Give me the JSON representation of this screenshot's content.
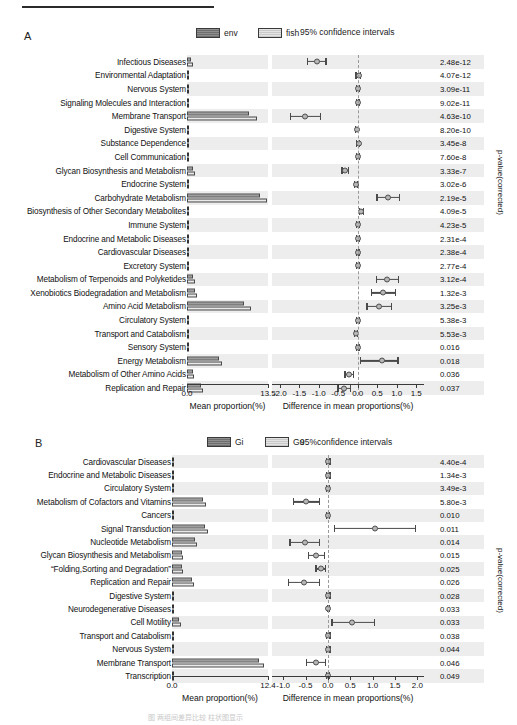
{
  "figure": {
    "footnote": "图 两组间差异比较 柱状图显示",
    "panels": [
      "A",
      "B"
    ]
  },
  "chart_data": [
    {
      "type": "bar",
      "panel": "A",
      "title": "",
      "legend": [
        {
          "label": "env",
          "style": "dark"
        },
        {
          "label": "fish",
          "style": "light"
        }
      ],
      "ci_title": "95% confidence intervals",
      "left_axis": {
        "xlabel": "Mean proportion(%)",
        "ticks": [
          0.0,
          13.5
        ],
        "tick_labels": [
          "0.0",
          "13.5"
        ],
        "xlim": [
          0.0,
          13.5
        ]
      },
      "right_axis": {
        "xlabel": "Difference in mean proportions(%)",
        "ticks": [
          -2.0,
          -1.5,
          -1.0,
          -0.5,
          0.0,
          0.5,
          1.0,
          1.5
        ],
        "tick_labels": [
          "-2.0",
          "-1.5",
          "-1.0",
          "-0.5",
          "0.0",
          "0.5",
          "1.0",
          "1.5"
        ],
        "xlim": [
          -2.2,
          1.7
        ]
      },
      "pvalue_axis_label": "p-value(corrected)",
      "categories": [
        "Infectious Diseases",
        "Environmental Adaptation",
        "Nervous System",
        "Signaling Molecules and Interaction",
        "Membrane Transport",
        "Digestive System",
        "Substance Dependence",
        "Cell Communication",
        "Glycan Biosynthesis and Metabolism",
        "Endocrine System",
        "Carbohydrate Metabolism",
        "Biosynthesis of Other Secondary Metabolites",
        "Immune System",
        "Endocrine and Metabolic Diseases",
        "Cardiovascular Diseases",
        "Excretory System",
        "Metabolism of Terpenoids and Polyketides",
        "Xenobiotics Biodegradation and Metabolism",
        "Amino Acid Metabolism",
        "Circulatory System",
        "Transport and Catabolism",
        "Sensory System",
        "Energy Metabolism",
        "Metabolism of Other Amino Acids",
        "Replication and Repair"
      ],
      "series": [
        {
          "name": "env",
          "values": [
            0.62,
            0.09,
            0.05,
            0.03,
            10.4,
            0.1,
            0.03,
            0.04,
            1.05,
            0.12,
            12.2,
            0.36,
            0.04,
            0.04,
            0.04,
            0.05,
            1.05,
            1.3,
            9.5,
            0.03,
            0.16,
            0.03,
            5.4,
            1.02,
            2.25
          ]
        },
        {
          "name": "fish",
          "values": [
            1.0,
            0.04,
            0.03,
            0.02,
            11.6,
            0.05,
            0.02,
            0.02,
            1.3,
            0.05,
            13.4,
            0.25,
            0.02,
            0.02,
            0.02,
            0.03,
            1.28,
            1.62,
            10.6,
            0.02,
            0.09,
            0.02,
            5.9,
            1.2,
            2.6
          ]
        }
      ],
      "ci": [
        {
          "low": -1.3,
          "mid": -1.05,
          "high": -0.8
        },
        {
          "low": -0.06,
          "mid": 0.02,
          "high": 0.08
        },
        {
          "low": -0.05,
          "mid": 0.01,
          "high": 0.06
        },
        {
          "low": -0.04,
          "mid": 0.0,
          "high": 0.05
        },
        {
          "low": -1.75,
          "mid": -1.35,
          "high": -0.95
        },
        {
          "low": -0.08,
          "mid": -0.02,
          "high": 0.04
        },
        {
          "low": -0.05,
          "mid": 0.02,
          "high": 0.07
        },
        {
          "low": -0.05,
          "mid": 0.01,
          "high": 0.06
        },
        {
          "low": -0.42,
          "mid": -0.32,
          "high": -0.22
        },
        {
          "low": -0.1,
          "mid": -0.04,
          "high": 0.02
        },
        {
          "low": 0.48,
          "mid": 0.78,
          "high": 1.08
        },
        {
          "low": 0.02,
          "mid": 0.09,
          "high": 0.16
        },
        {
          "low": -0.05,
          "mid": 0.01,
          "high": 0.06
        },
        {
          "low": -0.05,
          "mid": 0.01,
          "high": 0.06
        },
        {
          "low": -0.05,
          "mid": 0.0,
          "high": 0.05
        },
        {
          "low": -0.05,
          "mid": 0.0,
          "high": 0.05
        },
        {
          "low": 0.46,
          "mid": 0.76,
          "high": 1.06
        },
        {
          "low": 0.34,
          "mid": 0.66,
          "high": 0.98
        },
        {
          "low": 0.22,
          "mid": 0.55,
          "high": 0.88
        },
        {
          "low": -0.05,
          "mid": 0.0,
          "high": 0.05
        },
        {
          "low": -0.09,
          "mid": -0.04,
          "high": 0.01
        },
        {
          "low": -0.04,
          "mid": 0.0,
          "high": 0.05
        },
        {
          "low": 0.06,
          "mid": 0.62,
          "high": 1.05
        },
        {
          "low": -0.34,
          "mid": -0.22,
          "high": -0.1
        },
        {
          "low": -0.52,
          "mid": -0.34,
          "high": -0.16
        }
      ],
      "pvalues": [
        "2.48e-12",
        "4.07e-12",
        "3.09e-11",
        "9.02e-11",
        "4.63e-10",
        "8.20e-10",
        "3.45e-8",
        "7.60e-8",
        "3.33e-7",
        "3.02e-6",
        "2.19e-5",
        "4.09e-5",
        "4.23e-5",
        "2.31e-4",
        "2.38e-4",
        "2.77e-4",
        "3.12e-4",
        "1.32e-3",
        "3.25e-3",
        "5.38e-3",
        "5.53e-3",
        "0.016",
        "0.018",
        "0.036",
        "0.037"
      ]
    },
    {
      "type": "bar",
      "panel": "B",
      "title": "",
      "legend": [
        {
          "label": "Gi",
          "style": "dark"
        },
        {
          "label": "Gu",
          "style": "light"
        }
      ],
      "ci_title": "95%confidence intervals",
      "left_axis": {
        "xlabel": "Mean proportion(%)",
        "ticks": [
          0.0,
          12.4
        ],
        "tick_labels": [
          "0.0",
          "12.4"
        ],
        "xlim": [
          0.0,
          12.4
        ]
      },
      "right_axis": {
        "xlabel": "Difference in mean proportions(%)",
        "ticks": [
          -1.0,
          -0.5,
          0.0,
          0.5,
          1.0,
          1.5,
          2.0
        ],
        "tick_labels": [
          "-1.0",
          "-0.5",
          "0.0",
          "0.5",
          "1.0",
          "1.5",
          "2.0"
        ],
        "xlim": [
          -1.25,
          2.15
        ]
      },
      "pvalue_axis_label": "p-value(corrected)",
      "categories": [
        "Cardiovascular Diseases",
        "Endocrine and Metabolic Diseases",
        "Circulatory System",
        "Metabolism of Cofactors and Vitamins",
        "Cancers",
        "Signal Transduction",
        "Nucleotide Metabolism",
        "Glycan Biosynthesis and Metabolism",
        "“Folding,Sorting and Degradation”",
        "Replication and Repair",
        "Digestive System",
        "Neurodegenerative Diseases",
        "Cell Motility",
        "Transport and Catabolism",
        "Nervous System",
        "Membrane Transport",
        "Transcription"
      ],
      "series": [
        {
          "name": "Gi",
          "values": [
            0.04,
            0.08,
            0.05,
            3.95,
            0.13,
            4.25,
            3.0,
            1.25,
            1.3,
            2.55,
            0.06,
            0.05,
            0.95,
            0.14,
            0.05,
            11.2,
            0.13
          ]
        },
        {
          "name": "Gu",
          "values": [
            0.03,
            0.06,
            0.04,
            4.35,
            0.07,
            4.6,
            3.25,
            1.4,
            1.42,
            2.8,
            0.04,
            0.03,
            1.12,
            0.09,
            0.03,
            11.9,
            0.08
          ]
        }
      ],
      "ci": [
        {
          "low": -0.04,
          "mid": 0.01,
          "high": 0.06
        },
        {
          "low": -0.04,
          "mid": 0.01,
          "high": 0.06
        },
        {
          "low": -0.04,
          "mid": 0.0,
          "high": 0.05
        },
        {
          "low": -0.78,
          "mid": -0.48,
          "high": -0.18
        },
        {
          "low": -0.04,
          "mid": 0.0,
          "high": 0.05
        },
        {
          "low": 0.14,
          "mid": 1.06,
          "high": 1.98
        },
        {
          "low": -0.86,
          "mid": -0.52,
          "high": -0.18
        },
        {
          "low": -0.44,
          "mid": -0.26,
          "high": -0.06
        },
        {
          "low": -0.28,
          "mid": -0.16,
          "high": -0.04
        },
        {
          "low": -0.9,
          "mid": -0.54,
          "high": -0.18
        },
        {
          "low": -0.04,
          "mid": 0.01,
          "high": 0.06
        },
        {
          "low": -0.03,
          "mid": 0.01,
          "high": 0.05
        },
        {
          "low": 0.08,
          "mid": 0.55,
          "high": 1.05
        },
        {
          "low": -0.04,
          "mid": 0.01,
          "high": 0.06
        },
        {
          "low": -0.04,
          "mid": 0.01,
          "high": 0.06
        },
        {
          "low": -0.5,
          "mid": -0.26,
          "high": -0.04
        },
        {
          "low": -0.04,
          "mid": 0.0,
          "high": 0.05
        }
      ],
      "pvalues": [
        "4.40e-4",
        "1.34e-3",
        "3.49e-3",
        "5.80e-3",
        "0.010",
        "0.011",
        "0.014",
        "0.015",
        "0.025",
        "0.026",
        "0.028",
        "0.033",
        "0.033",
        "0.038",
        "0.044",
        "0.046",
        "0.049"
      ]
    }
  ]
}
